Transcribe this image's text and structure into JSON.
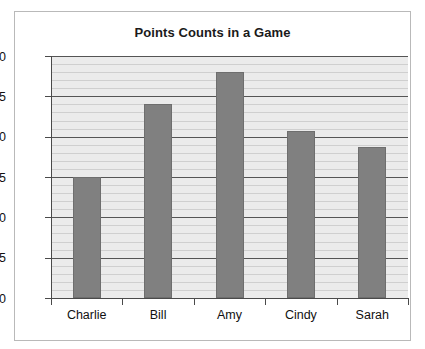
{
  "chart_data": {
    "type": "bar",
    "title": "Points Counts in a Game",
    "xlabel": "",
    "ylabel": "",
    "categories": [
      "Charlie",
      "Bill",
      "Amy",
      "Cindy",
      "Sarah"
    ],
    "values": [
      15,
      24,
      28,
      20.7,
      18.7
    ],
    "ylim": [
      0,
      30
    ],
    "yticks": [
      0,
      5,
      10,
      15,
      20,
      25,
      30
    ],
    "ytick_labels": [
      "0",
      "5",
      "10",
      "15",
      "20",
      "25",
      "30"
    ],
    "ytick_interval_major": 5,
    "ytick_interval_minor": 1,
    "grid": true,
    "grid_orientation": "horizontal",
    "legend": false,
    "legend_position": "none",
    "series": [
      {
        "name": "Points",
        "values": [
          15,
          24,
          28,
          20.7,
          18.7
        ]
      }
    ],
    "colors": {
      "bar_fill": "#808080",
      "bar_border": "#6e6e6e",
      "plot_background": "#e9e9e9",
      "grid_major": "#555555",
      "grid_minor": "#cfcfcf",
      "axis": "#4a4a4a",
      "frame_border": "#b9b9b9",
      "title_text": "#1a1a1a",
      "tick_text": "#111111",
      "page_background": "#ffffff"
    }
  }
}
